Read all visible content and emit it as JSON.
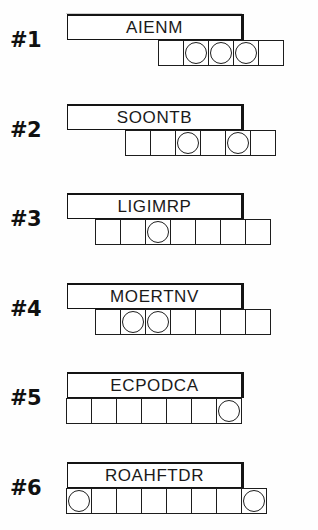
{
  "page": {
    "ink_color": "#1a1a1a",
    "paper_color": "#ffffff"
  },
  "puzzles": [
    {
      "index_label": "#1",
      "scrambled": "AIENM",
      "answer_cells": 5,
      "circled_positions": [
        2,
        3,
        4
      ]
    },
    {
      "index_label": "#2",
      "scrambled": "SOONTB",
      "answer_cells": 6,
      "circled_positions": [
        3,
        5
      ]
    },
    {
      "index_label": "#3",
      "scrambled": "LIGIMRP",
      "answer_cells": 7,
      "circled_positions": [
        3
      ]
    },
    {
      "index_label": "#4",
      "scrambled": "MOERTNV",
      "answer_cells": 7,
      "circled_positions": [
        2,
        3
      ]
    },
    {
      "index_label": "#5",
      "scrambled": "ECPODCA",
      "answer_cells": 7,
      "circled_positions": [
        7
      ]
    },
    {
      "index_label": "#6",
      "scrambled": "ROAHFTDR",
      "answer_cells": 8,
      "circled_positions": [
        1,
        8
      ]
    }
  ]
}
